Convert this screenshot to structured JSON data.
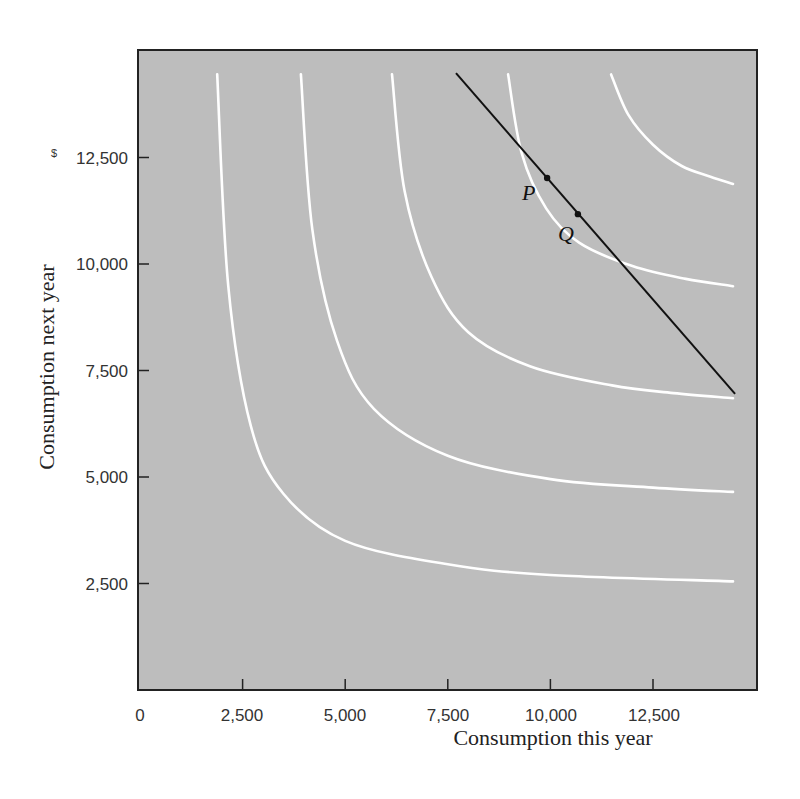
{
  "chart_data": {
    "type": "line",
    "title": "",
    "xlabel": "Consumption this year",
    "ylabel": "Consumption next year",
    "xlim": [
      0,
      15000
    ],
    "ylim": [
      0,
      15000
    ],
    "x_ticks": [
      0,
      2500,
      5000,
      7500,
      10000,
      12500
    ],
    "x_tick_labels": [
      "0",
      "2,500",
      "5,000",
      "7,500",
      "10,000",
      "12,500"
    ],
    "y_ticks": [
      2500,
      5000,
      7500,
      10000,
      12500
    ],
    "y_tick_labels": [
      "2,500",
      "5,000",
      "7,500",
      "10,000",
      "12,500"
    ],
    "y_top_tick_prefix": "$",
    "grid": false,
    "legend": null,
    "background_color": "#bdbdbd",
    "series": [
      {
        "name": "Indifference curve 1",
        "color": "#ffffff",
        "kind": "curve",
        "x": [
          1880,
          2150,
          2700,
          3500,
          5000,
          7500,
          10000,
          14450
        ],
        "y": [
          14450,
          9500,
          6200,
          4600,
          3500,
          2950,
          2700,
          2550
        ]
      },
      {
        "name": "Indifference curve 2",
        "color": "#ffffff",
        "kind": "curve",
        "x": [
          3920,
          4200,
          4800,
          5700,
          7500,
          10000,
          12500,
          14450
        ],
        "y": [
          14450,
          10800,
          8200,
          6600,
          5500,
          4950,
          4750,
          4650
        ]
      },
      {
        "name": "Indifference curve 3",
        "color": "#ffffff",
        "kind": "curve",
        "x": [
          6140,
          6450,
          7100,
          8000,
          9500,
          11500,
          13000,
          14450
        ],
        "y": [
          14450,
          11700,
          9700,
          8400,
          7600,
          7150,
          6970,
          6850
        ]
      },
      {
        "name": "Indifference curve 4",
        "color": "#ffffff",
        "kind": "curve",
        "x": [
          8970,
          9300,
          9900,
          10700,
          12000,
          13300,
          14450
        ],
        "y": [
          14450,
          12600,
          11300,
          10500,
          9950,
          9650,
          9480
        ]
      },
      {
        "name": "Indifference curve 5",
        "color": "#ffffff",
        "kind": "curve",
        "x": [
          11480,
          11900,
          12500,
          13200,
          13900,
          14450
        ],
        "y": [
          14450,
          13500,
          12800,
          12300,
          12050,
          11880
        ]
      },
      {
        "name": "Budget line",
        "color": "#111111",
        "kind": "line",
        "x": [
          7700,
          14500
        ],
        "y": [
          14480,
          6950
        ]
      }
    ],
    "annotations": [
      {
        "label": "P",
        "x": 9920,
        "y": 12020,
        "marker": "dot"
      },
      {
        "label": "Q",
        "x": 10670,
        "y": 11170,
        "marker": "dot"
      }
    ]
  },
  "labels": {
    "x_axis": "Consumption this year",
    "y_axis": "Consumption next year",
    "point_p": "P",
    "point_q": "Q",
    "dollar": "$"
  },
  "ticks": {
    "x": [
      "0",
      "2,500",
      "5,000",
      "7,500",
      "10,000",
      "12,500"
    ],
    "y": [
      "2,500",
      "5,000",
      "7,500",
      "10,000",
      "12,500"
    ]
  }
}
